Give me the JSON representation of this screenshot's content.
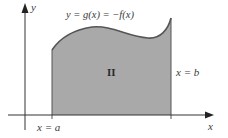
{
  "figure": {
    "type": "area-between-curve-and-axis",
    "axes": {
      "x_label": "x",
      "y_label": "y"
    },
    "curve_label": "y = g(x) = −f(x)",
    "region_label": "II",
    "left_bound_label": "x = a",
    "right_bound_label": "x = b",
    "colors": {
      "fill": "#a9a9a9",
      "curve": "#555555",
      "axis": "#333333",
      "text": "#3a3a3a"
    }
  }
}
